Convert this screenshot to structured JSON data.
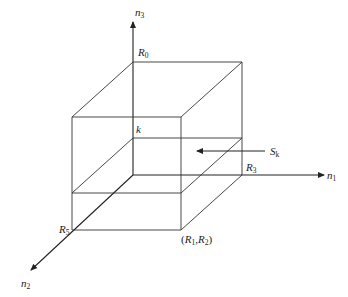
{
  "diagram": {
    "type": "3d-box-with-section-plane",
    "axes": [
      {
        "id": "n1",
        "label": "n",
        "subscript": "1",
        "direction": "right"
      },
      {
        "id": "n2",
        "label": "n",
        "subscript": "2",
        "direction": "down-left"
      },
      {
        "id": "n3",
        "label": "n",
        "subscript": "3",
        "direction": "up"
      }
    ],
    "points": {
      "R0": {
        "label": "R",
        "subscript": "0"
      },
      "R3": {
        "label": "R",
        "subscript": "3"
      },
      "R5": {
        "label": "R",
        "subscript": "5"
      },
      "R1R2": {
        "open": "(",
        "a": "R",
        "a_sub": "1",
        "sep": ",",
        "b": "R",
        "b_sub": "2",
        "close": ")"
      },
      "k": {
        "label": "k"
      }
    },
    "section": {
      "label": "S",
      "subscript": "k",
      "arrow": "points-left-into-plane"
    }
  }
}
